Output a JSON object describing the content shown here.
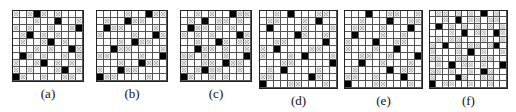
{
  "panels": [
    {
      "label": "(a)",
      "x": 12,
      "size": 10,
      "cell": 7,
      "rows": [
        "X.X■X.X...",
        "...X..■..X",
        "X.X..X..X■",
        ".X■.X.X...",
        ".X..X■.X..",
        "...X.X..■X",
        ".■X.X..X.X",
        "X..X■.X.X.",
        "X.X...X■.X",
        "■X..X..XX."
      ]
    },
    {
      "label": "(b)",
      "x": 96,
      "size": 10,
      "cell": 7,
      "rows": [
        "....X..■XX",
        ".X..■XX...",
        ".■XX....X.",
        "X....X..■X",
        "...X.■XX..",
        "..■XX....X",
        "XX....X..■",
        "...X..■XX.",
        "X..■XX....",
        "■XX....X.."
      ]
    },
    {
      "label": "(c)",
      "x": 180,
      "size": 10,
      "cell": 7,
      "rows": [
        "..X.X..■XX",
        ".X.■.XX.X.",
        ".■XX.X.X..",
        "X.X.X...■X",
        "..X..■X.XX",
        "..■XX.X..X",
        "XX.X..X..■",
        "X..XX.■XX.",
        "X.X■XX..X.",
        "■X..X.X..."
      ]
    },
    {
      "label": "(d)",
      "x": 259,
      "size": 11,
      "cell": 7,
      "rows": [
        "..X.■...XX.",
        ".XX...X.■..",
        ".■....X...X",
        ".....■X..X.",
        "..XX.....■.",
        "X.■....XX..",
        "X...X.■...X",
        "...XX.....■",
        ".X.■....X..",
        "XX.....■X..",
        "■...XX...X."
      ]
    },
    {
      "label": "(e)",
      "x": 344,
      "size": 11,
      "cell": 7,
      "rows": [
        "...■..XX..X",
        "..X...■..XX",
        ".XX..X...■.",
        ".■...X..X..",
        "X...■..XX..",
        "X...X..■...",
        "..XX..X...■",
        "..■..X...X.",
        ".X....■.XX.",
        "XX..X...■..",
        "■...XX...X."
      ]
    },
    {
      "label": "(f)",
      "x": 429,
      "size": 12,
      "cell": 6.4,
      "rows": [
        ".XX.X.X.■.X.",
        "..X.■.XX.XX.",
        ".■.X.X.X.X.X",
        "...X.■.XX.■X",
        ".X.XX...X..X",
        "X.■.X.XX.X■.",
        "X...X.■.X..X",
        "XX..XX..XX..",
        ".X.■.XX.X..■",
        "XX.X..X.■X..",
        "X...■X..XX..",
        "■.XX..X..X.."
      ]
    }
  ],
  "legend": {
    "black": "blocked-cell",
    "X": "crossed-cell",
    ".": "empty-cell"
  }
}
